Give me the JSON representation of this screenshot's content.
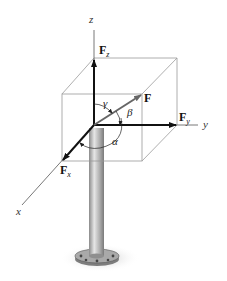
{
  "diagram": {
    "axes": {
      "x": "x",
      "y": "y",
      "z": "z"
    },
    "components": {
      "Fx": {
        "main": "F",
        "sub": "x"
      },
      "Fy": {
        "main": "F",
        "sub": "y"
      },
      "Fz": {
        "main": "F",
        "sub": "z"
      }
    },
    "force": "F",
    "angles": {
      "alpha": "α",
      "beta": "β",
      "gamma": "γ"
    },
    "colors": {
      "arrow": "#111111",
      "force_arrow": "#6e6e6e",
      "box": "#9a9a9a",
      "pole": "#b8b8b8"
    }
  }
}
